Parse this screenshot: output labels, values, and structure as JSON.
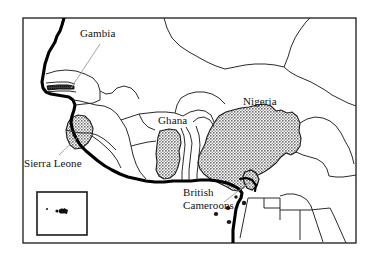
{
  "figure": {
    "kind": "map",
    "frame_color": "#1a1a1a",
    "background_color": "#ffffff",
    "border_color": "#2b2b2b",
    "coastline_color": "#000000",
    "shading_color": "#8d8d8d",
    "leader_line_color": "#9a9a9a"
  },
  "labels": {
    "gambia": "Gambia",
    "sierra_leone": "Sierra Leone",
    "ghana": "Ghana",
    "nigeria": "Nigeria",
    "british_cameroons_line1": "British",
    "british_cameroons_line2": "Cameroons"
  },
  "shaded_regions": [
    {
      "name": "gambia",
      "label": "Gambia",
      "fill": "#555555"
    },
    {
      "name": "sierra-leone",
      "label": "Sierra Leone",
      "fill": "#8d8d8d"
    },
    {
      "name": "ghana",
      "label": "Ghana",
      "fill": "#8d8d8d"
    },
    {
      "name": "nigeria",
      "label": "Nigeria",
      "fill": "#8d8d8d"
    },
    {
      "name": "southern-cameroons",
      "label": "British Cameroons",
      "fill": "#8d8d8d"
    }
  ],
  "inset": {
    "name": "inset-box",
    "description": "small inset box with island markers"
  }
}
